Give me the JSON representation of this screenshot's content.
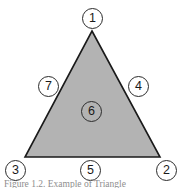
{
  "figure": {
    "type": "labeled-triangle-diagram",
    "background_color": "#ffffff",
    "caption": "Figure 1.2. Example of Triangle"
  },
  "shape": {
    "name": "triangle",
    "fill_color": "#b3b3b3",
    "stroke_color": "#1a1a1a",
    "vertices": [
      {
        "name": "apex",
        "x": 92,
        "y": 31
      },
      {
        "name": "bottom-right",
        "x": 160,
        "y": 157
      },
      {
        "name": "bottom-left",
        "x": 25,
        "y": 157
      }
    ]
  },
  "markers": [
    {
      "id": "marker-1",
      "label": "1",
      "x": 82,
      "y": 8,
      "position": "apex-top"
    },
    {
      "id": "marker-2",
      "label": "2",
      "x": 156,
      "y": 160,
      "position": "bottom-right-vertex"
    },
    {
      "id": "marker-3",
      "label": "3",
      "x": 5,
      "y": 160,
      "position": "bottom-left-vertex"
    },
    {
      "id": "marker-4",
      "label": "4",
      "x": 128,
      "y": 76,
      "position": "right-edge"
    },
    {
      "id": "marker-5",
      "label": "5",
      "x": 80,
      "y": 160,
      "position": "bottom-edge"
    },
    {
      "id": "marker-6",
      "label": "6",
      "x": 81,
      "y": 101,
      "position": "interior-center"
    },
    {
      "id": "marker-7",
      "label": "7",
      "x": 38,
      "y": 76,
      "position": "left-edge"
    }
  ]
}
